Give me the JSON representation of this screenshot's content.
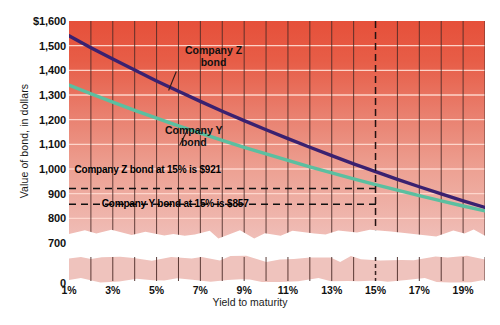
{
  "chart_data": {
    "type": "line",
    "title": "",
    "xlabel": "Yield to maturity",
    "ylabel": "Value of bond, in dollars",
    "xlim": [
      1,
      20
    ],
    "ylim": [
      700,
      1600
    ],
    "ylim_break": true,
    "y_baseline_label": "0",
    "grid": true,
    "legend_position": "inline-callout",
    "x_tick_labels": [
      "1%",
      "3%",
      "5%",
      "7%",
      "9%",
      "11%",
      "13%",
      "15%",
      "17%",
      "19%"
    ],
    "x_tick_values": [
      1,
      3,
      5,
      7,
      9,
      11,
      13,
      15,
      17,
      19
    ],
    "x_minor_tick_values": [
      2,
      4,
      6,
      8,
      10,
      12,
      14,
      16,
      18,
      20
    ],
    "y_tick_labels": [
      "$1,600",
      "1,500",
      "1,400",
      "1,300",
      "1,200",
      "1,100",
      "1,000",
      "900",
      "800",
      "700",
      "0"
    ],
    "y_tick_values": [
      1600,
      1500,
      1400,
      1300,
      1200,
      1100,
      1000,
      900,
      800,
      700,
      0
    ],
    "series": [
      {
        "name": "Company Z bond",
        "color": "#3a2170",
        "x": [
          1,
          2,
          3,
          4,
          5,
          6,
          7,
          8,
          9,
          10,
          11,
          12,
          13,
          14,
          15,
          16,
          17,
          18,
          19,
          20
        ],
        "values": [
          1540,
          1492,
          1446,
          1401,
          1357,
          1315,
          1274,
          1234,
          1196,
          1159,
          1123,
          1088,
          1054,
          1021,
          989,
          958,
          928,
          899,
          871,
          844
        ]
      },
      {
        "name": "Company Y bond",
        "color": "#5bbfa0",
        "x": [
          1,
          2,
          3,
          4,
          5,
          6,
          7,
          8,
          9,
          10,
          11,
          12,
          13,
          14,
          15,
          16,
          17,
          18,
          19,
          20
        ],
        "values": [
          1340,
          1305,
          1271,
          1238,
          1206,
          1175,
          1145,
          1116,
          1088,
          1061,
          1035,
          1009,
          984,
          960,
          937,
          914,
          892,
          871,
          850,
          830
        ]
      }
    ],
    "callouts": [
      {
        "name": "series-label-z",
        "text_line1": "Company Z",
        "text_line2": "bond"
      },
      {
        "name": "series-label-y",
        "text_line1": "Company Y",
        "text_line2": "bond"
      }
    ],
    "reference_lines": [
      {
        "name": "z-at-15",
        "label": "Company Z bond at 15% is $921",
        "value": 921,
        "at_x": 15,
        "style": "dashed"
      },
      {
        "name": "y-at-15",
        "label": "Company Y bond at 15% is $857",
        "value": 857,
        "at_x": 15,
        "style": "dashed"
      },
      {
        "name": "x-15-marker",
        "label": "",
        "at_x": 15,
        "style": "dashed-vertical"
      }
    ],
    "colors": {
      "plot_bg_top": "#e8543f",
      "plot_bg_bottom": "#efb9b2",
      "gridline": "#ffd9cf",
      "vertical_tick": "#3b2020",
      "series_z": "#3a2170",
      "series_y": "#5bbfa0",
      "text": "#111111"
    }
  }
}
